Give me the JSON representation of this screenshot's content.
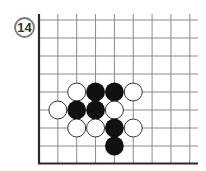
{
  "problem": {
    "number": "14"
  },
  "board": {
    "description": "Partial Go board (lower-left corner region), 9 columns x 9 rows visible",
    "edges": [
      "left",
      "bottom"
    ],
    "columns": 9,
    "rows": 9,
    "colors": {
      "background": "#ffffff",
      "grid_line": "#8a8a8a",
      "edge_line": "#2a2a2a",
      "black_stone": "#111111",
      "white_stone_fill": "#ffffff",
      "white_stone_outline": "#333333",
      "label_circle": "#777777",
      "label_text": "#333333"
    }
  },
  "stones": [
    {
      "color": "white",
      "col": 2,
      "row": 4
    },
    {
      "color": "black",
      "col": 3,
      "row": 4
    },
    {
      "color": "black",
      "col": 4,
      "row": 4
    },
    {
      "color": "white",
      "col": 5,
      "row": 4
    },
    {
      "color": "white",
      "col": 1,
      "row": 5
    },
    {
      "color": "black",
      "col": 2,
      "row": 5
    },
    {
      "color": "black",
      "col": 3,
      "row": 5
    },
    {
      "color": "white",
      "col": 4,
      "row": 5
    },
    {
      "color": "white",
      "col": 2,
      "row": 6
    },
    {
      "color": "white",
      "col": 3,
      "row": 6
    },
    {
      "color": "black",
      "col": 4,
      "row": 6
    },
    {
      "color": "white",
      "col": 5,
      "row": 6
    },
    {
      "color": "black",
      "col": 4,
      "row": 7
    }
  ]
}
